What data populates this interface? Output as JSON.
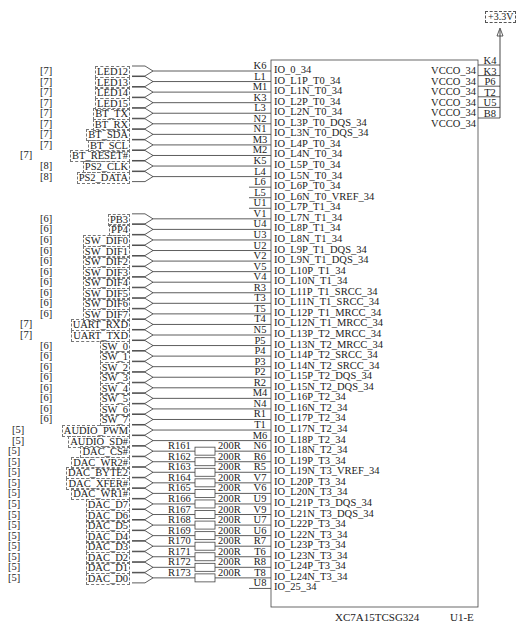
{
  "power": {
    "label": "+3.3V"
  },
  "chip": {
    "part_number": "XC7A15TCSG324",
    "designator": "U1-E",
    "vcco_pins": [
      {
        "pin": "K4",
        "name": "VCCO_34"
      },
      {
        "pin": "K3",
        "name": "VCCO_34"
      },
      {
        "pin": "P6",
        "name": "VCCO_34"
      },
      {
        "pin": "T2",
        "name": "VCCO_34"
      },
      {
        "pin": "U5",
        "name": "VCCO_34"
      },
      {
        "pin": "B8",
        "name": "VCCO_34"
      }
    ]
  },
  "rows": [
    {
      "sheet": "[7]",
      "signal": "LED12",
      "res": "",
      "val": "",
      "pin": "K6",
      "io": "IO_0_34"
    },
    {
      "sheet": "[7]",
      "signal": "LED13",
      "res": "",
      "val": "",
      "pin": "L1",
      "io": "IO_L1P_T0_34"
    },
    {
      "sheet": "[7]",
      "signal": "LED14",
      "res": "",
      "val": "",
      "pin": "M1",
      "io": "IO_L1N_T0_34"
    },
    {
      "sheet": "[7]",
      "signal": "LED15",
      "res": "",
      "val": "",
      "pin": "K3",
      "io": "IO_L2P_T0_34"
    },
    {
      "sheet": "[7]",
      "signal": "BT_TX",
      "res": "",
      "val": "",
      "pin": "L3",
      "io": "IO_L2N_T0_34"
    },
    {
      "sheet": "[7]",
      "signal": "BT_RX",
      "res": "",
      "val": "",
      "pin": "N2",
      "io": "IO_L3P_T0_DQS_34"
    },
    {
      "sheet": "[7]",
      "signal": "BT_SDA",
      "res": "",
      "val": "",
      "pin": "N1",
      "io": "IO_L3N_T0_DQS_34"
    },
    {
      "sheet": "[7]",
      "signal": "BT_SCL",
      "res": "",
      "val": "",
      "pin": "M3",
      "io": "IO_L4P_T0_34"
    },
    {
      "sheet": "[7]",
      "signal": "BT_RESET#",
      "res": "",
      "val": "",
      "pin": "M2",
      "io": "IO_L4N_T0_34"
    },
    {
      "sheet": "[8]",
      "signal": "PS2_CLK",
      "res": "",
      "val": "",
      "pin": "K5",
      "io": "IO_L5P_T0_34"
    },
    {
      "sheet": "[8]",
      "signal": "PS2_DATA",
      "res": "",
      "val": "",
      "pin": "L4",
      "io": "IO_L5N_T0_34"
    },
    {
      "sheet": "",
      "signal": "",
      "res": "",
      "val": "",
      "pin": "L6",
      "io": "IO_L6P_T0_34"
    },
    {
      "sheet": "",
      "signal": "",
      "res": "",
      "val": "",
      "pin": "L5",
      "io": "IO_L6N_T0_VREF_34"
    },
    {
      "sheet": "",
      "signal": "",
      "res": "",
      "val": "",
      "pin": "U1",
      "io": "IO_L7P_T1_34"
    },
    {
      "sheet": "[6]",
      "signal": "PB3",
      "res": "",
      "val": "",
      "pin": "V1",
      "io": "IO_L7N_T1_34"
    },
    {
      "sheet": "[6]",
      "signal": "PP4",
      "res": "",
      "val": "",
      "pin": "U4",
      "io": "IO_L8P_T1_34"
    },
    {
      "sheet": "[6]",
      "signal": "SW_DIF0",
      "res": "",
      "val": "",
      "pin": "U3",
      "io": "IO_L8N_T1_34"
    },
    {
      "sheet": "[6]",
      "signal": "SW_DIF1",
      "res": "",
      "val": "",
      "pin": "U2",
      "io": "IO_L9P_T1_DQS_34"
    },
    {
      "sheet": "[6]",
      "signal": "SW_DIF2",
      "res": "",
      "val": "",
      "pin": "V2",
      "io": "IO_L9N_T1_DQS_34"
    },
    {
      "sheet": "[6]",
      "signal": "SW_DIF3",
      "res": "",
      "val": "",
      "pin": "V5",
      "io": "IO_L10P_T1_34"
    },
    {
      "sheet": "[6]",
      "signal": "SW_DIF4",
      "res": "",
      "val": "",
      "pin": "V4",
      "io": "IO_L10N_T1_34"
    },
    {
      "sheet": "[6]",
      "signal": "SW_DIF5",
      "res": "",
      "val": "",
      "pin": "R3",
      "io": "IO_L11P_T1_SRCC_34"
    },
    {
      "sheet": "[6]",
      "signal": "SW_DIF6",
      "res": "",
      "val": "",
      "pin": "T3",
      "io": "IO_L11N_T1_SRCC_34"
    },
    {
      "sheet": "[6]",
      "signal": "SW_DIF7",
      "res": "",
      "val": "",
      "pin": "T5",
      "io": "IO_L12P_T1_MRCC_34"
    },
    {
      "sheet": "[7]",
      "signal": "UART_RXD",
      "res": "",
      "val": "",
      "pin": "T4",
      "io": "IO_L12N_T1_MRCC_34"
    },
    {
      "sheet": "[7]",
      "signal": "UART_TXD",
      "res": "",
      "val": "",
      "pin": "N5",
      "io": "IO_L13P_T2_MRCC_34"
    },
    {
      "sheet": "[6]",
      "signal": "SW_0",
      "res": "",
      "val": "",
      "pin": "P5",
      "io": "IO_L13N_T2_MRCC_34"
    },
    {
      "sheet": "[6]",
      "signal": "SW_1",
      "res": "",
      "val": "",
      "pin": "P4",
      "io": "IO_L14P_T2_SRCC_34"
    },
    {
      "sheet": "[6]",
      "signal": "SW_2",
      "res": "",
      "val": "",
      "pin": "P3",
      "io": "IO_L14N_T2_SRCC_34"
    },
    {
      "sheet": "[6]",
      "signal": "SW_3",
      "res": "",
      "val": "",
      "pin": "P2",
      "io": "IO_L15P_T2_DQS_34"
    },
    {
      "sheet": "[6]",
      "signal": "SW_4",
      "res": "",
      "val": "",
      "pin": "R2",
      "io": "IO_L15N_T2_DQS_34"
    },
    {
      "sheet": "[6]",
      "signal": "SW_5",
      "res": "",
      "val": "",
      "pin": "M4",
      "io": "IO_L16P_T2_34"
    },
    {
      "sheet": "[6]",
      "signal": "SW_6",
      "res": "",
      "val": "",
      "pin": "N4",
      "io": "IO_L16N_T2_34"
    },
    {
      "sheet": "[6]",
      "signal": "SW_7",
      "res": "",
      "val": "",
      "pin": "R1",
      "io": "IO_L17P_T2_34"
    },
    {
      "sheet": "[5]",
      "signal": "AUDIO_PWM",
      "res": "",
      "val": "",
      "pin": "T1",
      "io": "IO_L17N_T2_34"
    },
    {
      "sheet": "[5]",
      "signal": "AUDIO_SD#",
      "res": "",
      "val": "",
      "pin": "M6",
      "io": "IO_L18P_T2_34"
    },
    {
      "sheet": "[5]",
      "signal": "DAC_CS#",
      "res": "R161",
      "val": "200R",
      "pin": "N6",
      "io": "IO_L18N_T2_34"
    },
    {
      "sheet": "[5]",
      "signal": "DAC_WR2#",
      "res": "R162",
      "val": "200R",
      "pin": "R6",
      "io": "IO_L19P_T3_34"
    },
    {
      "sheet": "[5]",
      "signal": "DAC_BYTE2",
      "res": "R163",
      "val": "200R",
      "pin": "R5",
      "io": "IO_L19N_T3_VREF_34"
    },
    {
      "sheet": "[5]",
      "signal": "DAC_XFER#",
      "res": "R164",
      "val": "200R",
      "pin": "V7",
      "io": "IO_L20P_T3_34"
    },
    {
      "sheet": "[5]",
      "signal": "DAC_WR1#",
      "res": "R165",
      "val": "200R",
      "pin": "V6",
      "io": "IO_L20N_T3_34"
    },
    {
      "sheet": "[5]",
      "signal": "DAC_D7",
      "res": "R166",
      "val": "200R",
      "pin": "U9",
      "io": "IO_L21P_T3_DQS_34"
    },
    {
      "sheet": "[5]",
      "signal": "DAC_D6",
      "res": "R167",
      "val": "200R",
      "pin": "V9",
      "io": "IO_L21N_T3_DQS_34"
    },
    {
      "sheet": "[5]",
      "signal": "DAC_D5",
      "res": "R168",
      "val": "200R",
      "pin": "U7",
      "io": "IO_L22P_T3_34"
    },
    {
      "sheet": "[5]",
      "signal": "DAC_D4",
      "res": "R169",
      "val": "200R",
      "pin": "U6",
      "io": "IO_L22N_T3_34"
    },
    {
      "sheet": "[5]",
      "signal": "DAC_D3",
      "res": "R170",
      "val": "200R",
      "pin": "R7",
      "io": "IO_L23P_T3_34"
    },
    {
      "sheet": "[5]",
      "signal": "DAC_D2",
      "res": "R171",
      "val": "200R",
      "pin": "T6",
      "io": "IO_L23N_T3_34"
    },
    {
      "sheet": "[5]",
      "signal": "DAC_D1",
      "res": "R172",
      "val": "200R",
      "pin": "R8",
      "io": "IO_L24P_T3_34"
    },
    {
      "sheet": "[5]",
      "signal": "DAC_D0",
      "res": "R173",
      "val": "200R",
      "pin": "T8",
      "io": "IO_L24N_T3_34"
    },
    {
      "sheet": "",
      "signal": "",
      "res": "",
      "val": "",
      "pin": "U8",
      "io": "IO_25_34"
    }
  ]
}
